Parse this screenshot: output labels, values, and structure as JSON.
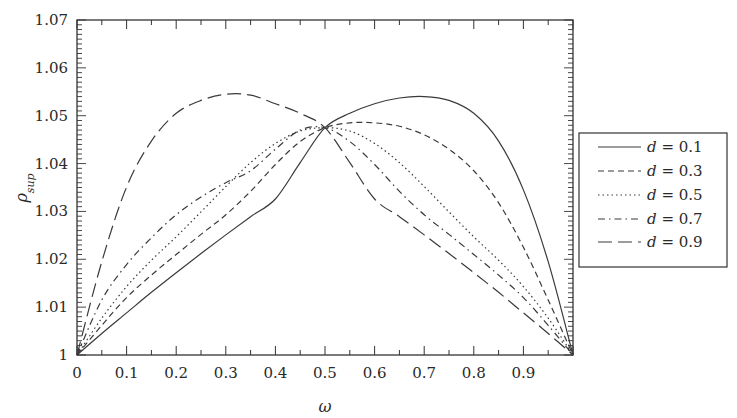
{
  "chart_data": {
    "type": "line",
    "title": "",
    "xlabel": "ω",
    "ylabel": "ρ_sup",
    "xlim": [
      0,
      1
    ],
    "ylim": [
      1.0,
      1.07
    ],
    "xticks": [
      "0",
      "0.1",
      "0.2",
      "0.3",
      "0.4",
      "0.5",
      "0.6",
      "0.7",
      "0.8",
      "0.9"
    ],
    "yticks": [
      "1",
      "1.01",
      "1.02",
      "1.03",
      "1.04",
      "1.05",
      "1.06",
      "1.07"
    ],
    "grid": false,
    "legend_position": "outside-right",
    "x": [
      0,
      0.05,
      0.1,
      0.15,
      0.2,
      0.25,
      0.3,
      0.35,
      0.4,
      0.45,
      0.5,
      0.55,
      0.6,
      0.65,
      0.7,
      0.75,
      0.8,
      0.85,
      0.9,
      0.95,
      1.0
    ],
    "series": [
      {
        "name": "d = 0.1",
        "style": "solid",
        "values": [
          1.0,
          1.0045,
          1.0088,
          1.0131,
          1.0172,
          1.0212,
          1.0251,
          1.0289,
          1.0326,
          1.0402,
          1.0475,
          1.0505,
          1.0525,
          1.0537,
          1.054,
          1.0532,
          1.0505,
          1.0447,
          1.0345,
          1.0195,
          1.0
        ]
      },
      {
        "name": "d = 0.3",
        "style": "dashed",
        "values": [
          1.0,
          1.0062,
          1.012,
          1.0167,
          1.021,
          1.0252,
          1.0293,
          1.0342,
          1.0398,
          1.0446,
          1.0475,
          1.0485,
          1.0485,
          1.0478,
          1.046,
          1.043,
          1.0385,
          1.0318,
          1.0225,
          1.0115,
          1.0
        ]
      },
      {
        "name": "d = 0.5",
        "style": "dotted",
        "values": [
          1.0,
          1.0077,
          1.0143,
          1.0198,
          1.0247,
          1.0299,
          1.0352,
          1.0402,
          1.0442,
          1.0468,
          1.0475,
          1.0468,
          1.0442,
          1.0402,
          1.0352,
          1.0299,
          1.0247,
          1.0198,
          1.0143,
          1.0077,
          1.0
        ]
      },
      {
        "name": "d = 0.7",
        "style": "dash-dot",
        "values": [
          1.0,
          1.0115,
          1.0189,
          1.0245,
          1.0293,
          1.033,
          1.036,
          1.0385,
          1.043,
          1.047,
          1.0475,
          1.0446,
          1.0398,
          1.0342,
          1.0293,
          1.0252,
          1.021,
          1.0167,
          1.012,
          1.0062,
          1.0
        ]
      },
      {
        "name": "d = 0.9",
        "style": "long-dashed",
        "values": [
          1.0,
          1.0195,
          1.0351,
          1.0447,
          1.0505,
          1.0532,
          1.0545,
          1.0543,
          1.0525,
          1.0505,
          1.0475,
          1.0402,
          1.0326,
          1.0289,
          1.0251,
          1.0212,
          1.0172,
          1.0131,
          1.0088,
          1.0045,
          1.0
        ]
      }
    ]
  },
  "legend": {
    "items": [
      {
        "label": "= 0.1",
        "var": "d"
      },
      {
        "label": "= 0.3",
        "var": "d"
      },
      {
        "label": "= 0.5",
        "var": "d"
      },
      {
        "label": "= 0.7",
        "var": "d"
      },
      {
        "label": "= 0.9",
        "var": "d"
      }
    ]
  },
  "axes": {
    "x_label": "ω",
    "y_label_main": "ρ",
    "y_label_sub": "sup"
  },
  "colors": {
    "line": "#3a3a3a",
    "frame": "#333333",
    "text": "#2a2a2a"
  }
}
